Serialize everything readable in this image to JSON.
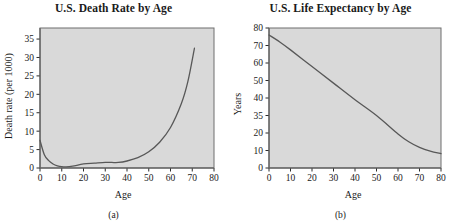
{
  "figure": {
    "panels": [
      {
        "caption": "(a)",
        "title": "U.S. Death Rate by Age",
        "xlabel": "Age",
        "ylabel": "Death rate (per 1000)"
      },
      {
        "caption": "(b)",
        "title": "U.S. Life Expectancy by Age",
        "xlabel": "Age",
        "ylabel": "Years"
      }
    ]
  },
  "chart_data": [
    {
      "type": "line",
      "title": "U.S. Death Rate by Age",
      "xlabel": "Age",
      "ylabel": "Death rate (per 1000)",
      "xlim": [
        0,
        80
      ],
      "ylim": [
        0,
        38
      ],
      "xticks": [
        0,
        10,
        20,
        30,
        40,
        50,
        60,
        70,
        80
      ],
      "xticklabels": [
        "0",
        "10",
        "20",
        "30",
        "40",
        "50",
        "60",
        "70",
        "80"
      ],
      "yticks": [
        0,
        5,
        10,
        15,
        20,
        25,
        30,
        35
      ],
      "yticklabels": [
        "0",
        "5",
        "10",
        "15",
        "20",
        "25",
        "30",
        "35"
      ],
      "grid": false,
      "legend": false,
      "x": [
        0,
        2,
        4,
        6,
        8,
        10,
        12,
        15,
        20,
        25,
        30,
        33,
        36,
        40,
        45,
        50,
        55,
        60,
        65,
        68,
        71
      ],
      "y": [
        7.5,
        3.6,
        2.0,
        1.1,
        0.6,
        0.35,
        0.3,
        0.5,
        1.1,
        1.3,
        1.5,
        1.5,
        1.5,
        1.9,
        2.8,
        4.4,
        7.0,
        11.0,
        17.5,
        23.5,
        32.5
      ]
    },
    {
      "type": "line",
      "title": "U.S. Life Expectancy by Age",
      "xlabel": "Age",
      "ylabel": "Years",
      "xlim": [
        0,
        80
      ],
      "ylim": [
        0,
        80
      ],
      "xticks": [
        0,
        10,
        20,
        30,
        40,
        50,
        60,
        70,
        80
      ],
      "xticklabels": [
        "0",
        "10",
        "20",
        "30",
        "40",
        "50",
        "60",
        "70",
        "80"
      ],
      "yticks": [
        0,
        10,
        20,
        30,
        40,
        50,
        60,
        70,
        80
      ],
      "yticklabels": [
        "0",
        "10",
        "20",
        "35",
        "40",
        "50",
        "60",
        "70",
        "80"
      ],
      "grid": false,
      "legend": false,
      "x": [
        0,
        5,
        10,
        20,
        30,
        40,
        50,
        60,
        65,
        70,
        75,
        80
      ],
      "y": [
        76.0,
        72.0,
        67.5,
        58.0,
        48.5,
        39.0,
        30.0,
        19.5,
        15.0,
        11.8,
        9.6,
        8.2
      ]
    }
  ]
}
